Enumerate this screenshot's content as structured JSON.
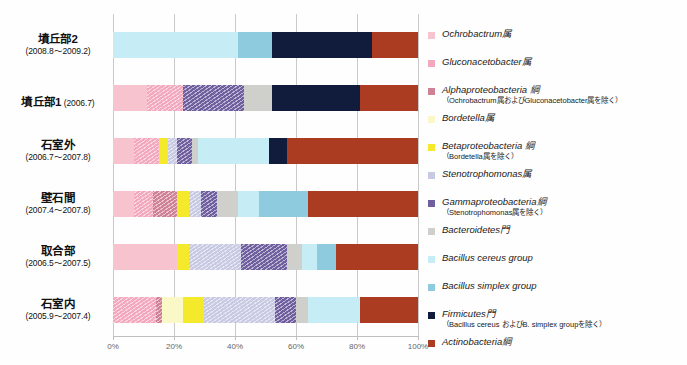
{
  "chart_data": {
    "type": "bar",
    "orientation": "horizontal",
    "stacked": true,
    "normalized": true,
    "title": "",
    "xlabel": "",
    "ylabel": "",
    "xlim": [
      0,
      100
    ],
    "xticks": [
      "0%",
      "20%",
      "40%",
      "60%",
      "80%",
      "100%"
    ],
    "xtick_values": [
      0,
      20,
      40,
      60,
      80,
      100
    ],
    "grid": true,
    "legend_position": "right",
    "categories": [
      "墳丘部2",
      "墳丘部1",
      "石室外",
      "壁石間",
      "取合部",
      "石室内"
    ],
    "category_periods": [
      "(2008.8〜2009.2)",
      "(2006.7)",
      "(2006.7〜2007.8)",
      "(2007.4〜2007.8)",
      "(2006.5〜2007.5)",
      "(2005.9〜2007.4)"
    ],
    "series": [
      {
        "name": "Ochrobactrum属",
        "key": "ochrobactrum",
        "color": "#f6c3ce",
        "pattern": "solid",
        "values": [
          0,
          11,
          7,
          7,
          21,
          0
        ]
      },
      {
        "name": "Gluconacetobacter属",
        "key": "gluconacetobacter",
        "color": "#f4a8bd",
        "pattern": "hatch",
        "values": [
          0,
          12,
          8,
          6,
          0,
          14
        ]
      },
      {
        "name": "Alphaproteobacteria 綱",
        "key": "alphaproteobacteria",
        "color": "#cf8296",
        "pattern": "hatch",
        "values": [
          0,
          0,
          0,
          8,
          0,
          2
        ]
      },
      {
        "name": "Bordetella属",
        "key": "bordetella",
        "color": "#fbf8c8",
        "pattern": "solid",
        "values": [
          0,
          0,
          0,
          0,
          0,
          7
        ]
      },
      {
        "name": "Betaproteobacteria 綱",
        "key": "betaproteobacteria",
        "color": "#f5e92b",
        "pattern": "solid",
        "values": [
          0,
          0,
          3,
          4,
          4,
          7
        ]
      },
      {
        "name": "Stenotrophomonas属",
        "key": "stenotrophomonas",
        "color": "#c8c9e2",
        "pattern": "hatch",
        "values": [
          0,
          0,
          3,
          4,
          17,
          23
        ]
      },
      {
        "name": "Gammaproteobacteria綱",
        "key": "gammaproteobacteria",
        "color": "#6f5f9e",
        "pattern": "hatch",
        "values": [
          0,
          20,
          5,
          5,
          15,
          7
        ]
      },
      {
        "name": "Bacteroidetes門",
        "key": "bacteroidetes",
        "color": "#cfcfcb",
        "pattern": "solid",
        "values": [
          0,
          9,
          2,
          7,
          5,
          4
        ]
      },
      {
        "name": "Bacillus cereus group",
        "key": "bacillus_cereus",
        "color": "#c6ecf5",
        "pattern": "solid",
        "values": [
          41,
          0,
          23,
          7,
          5,
          17
        ]
      },
      {
        "name": "Bacillus simplex group",
        "key": "bacillus_simplex",
        "color": "#8ecbdf",
        "pattern": "solid",
        "values": [
          11,
          0,
          0,
          16,
          6,
          0
        ]
      },
      {
        "name": "Firmicutes門",
        "key": "firmicutes",
        "color": "#111c3d",
        "pattern": "solid",
        "values": [
          33,
          29,
          6,
          0,
          0,
          0
        ]
      },
      {
        "name": "Actinobacteria綱",
        "key": "actinobacteria",
        "color": "#ab3b21",
        "pattern": "solid",
        "values": [
          15,
          19,
          43,
          36,
          27,
          19
        ]
      }
    ]
  },
  "legend": {
    "items": [
      {
        "main": "Ochrobactrum属",
        "sub": ""
      },
      {
        "main": "Gluconacetobacter属",
        "sub": ""
      },
      {
        "main": "Alphaproteobacteria 綱",
        "sub": "（Ochrobactrum属およびGluconacetobacter属を除く）"
      },
      {
        "main": "Bordetella属",
        "sub": ""
      },
      {
        "main": "Betaproteobacteria 綱",
        "sub": "（Bordetella属を除く）"
      },
      {
        "main": "Stenotrophomonas属",
        "sub": ""
      },
      {
        "main": "Gammaproteobacteria綱",
        "sub": "（Stenotrophomonas属を除く）"
      },
      {
        "main": "Bacteroidetes門",
        "sub": ""
      },
      {
        "main": "Bacillus cereus group",
        "sub": ""
      },
      {
        "main": "Bacillus simplex group",
        "sub": ""
      },
      {
        "main": "Firmicutes門",
        "sub": "（Bacillus cereus およびB. simplex groupを除く）"
      },
      {
        "main": "Actinobacteria綱",
        "sub": ""
      }
    ]
  }
}
